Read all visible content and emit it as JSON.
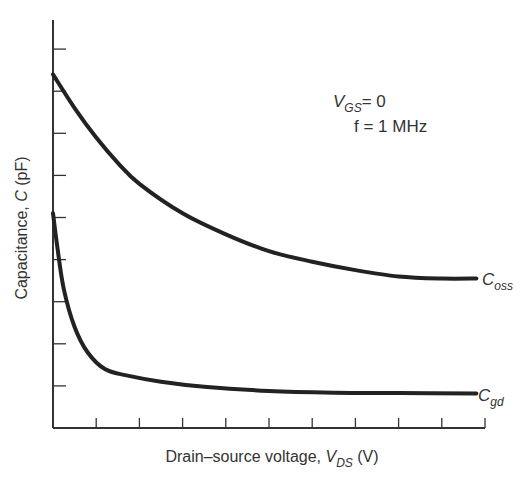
{
  "chart_data": {
    "type": "line",
    "title": "",
    "xlabel": "Drain-source voltage, V_DS (V)",
    "ylabel": "Capacitance, C (pF)",
    "x_ticks_count": 10,
    "y_ticks_count": 9,
    "tick_labels": "none (unlabeled ticks)",
    "xlim": [
      0,
      10
    ],
    "ylim": [
      0,
      9.5
    ],
    "grid": false,
    "legend": "inline labels at curve ends",
    "annotations": [
      "V_GS = 0",
      "f = 1 MHz"
    ],
    "series": [
      {
        "name": "C_oss",
        "x": [
          0,
          0.5,
          1,
          1.5,
          2,
          3,
          4,
          5,
          6,
          7,
          8,
          9,
          9.8
        ],
        "values": [
          8.4,
          7.6,
          6.9,
          6.3,
          5.8,
          5.1,
          4.6,
          4.2,
          3.95,
          3.75,
          3.6,
          3.55,
          3.55
        ]
      },
      {
        "name": "C_gd",
        "x": [
          0,
          0.1,
          0.25,
          0.5,
          0.8,
          1.2,
          1.7,
          2.5,
          3.5,
          5,
          6.5,
          8,
          9.8
        ],
        "values": [
          5.1,
          4.3,
          3.3,
          2.4,
          1.8,
          1.4,
          1.25,
          1.1,
          0.98,
          0.88,
          0.84,
          0.83,
          0.82
        ]
      }
    ]
  },
  "labels": {
    "ylabel_text": "Capacitance, ",
    "ylabel_var": "C",
    "ylabel_unit": " (pF)",
    "xlabel_text": "Drain–source voltage, ",
    "xlabel_var": "V",
    "xlabel_sub": "DS",
    "xlabel_unit": " (V)",
    "cond_vgs_var": "V",
    "cond_vgs_sub": "GS",
    "cond_vgs_val": "= 0",
    "cond_freq": "f = 1 MHz",
    "coss_var": "C",
    "coss_sub": "oss",
    "cgd_var": "C",
    "cgd_sub": "gd"
  },
  "style": {
    "line_color": "#222222",
    "axis_color": "#333333"
  }
}
